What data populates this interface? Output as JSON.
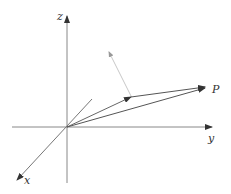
{
  "diagram": {
    "type": "3d-coordinate-vectors",
    "axes": {
      "z_label": "z",
      "y_label": "y",
      "x_label": "x"
    },
    "point_label": "P",
    "colors": {
      "axis": "#888888",
      "vector": "#555555",
      "light_vector": "#c8c8c8",
      "arrow": "#333333"
    }
  }
}
